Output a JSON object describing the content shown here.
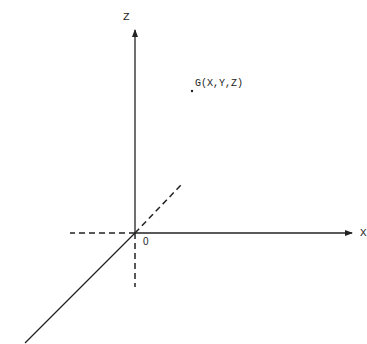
{
  "diagram": {
    "type": "3d-coordinate-axes",
    "axes": {
      "x_label": "X",
      "z_label": "Z",
      "origin_label": "0"
    },
    "point": {
      "label": "G(X,Y,Z)"
    },
    "colors": {
      "stroke": "#222222",
      "background": "#ffffff"
    }
  }
}
